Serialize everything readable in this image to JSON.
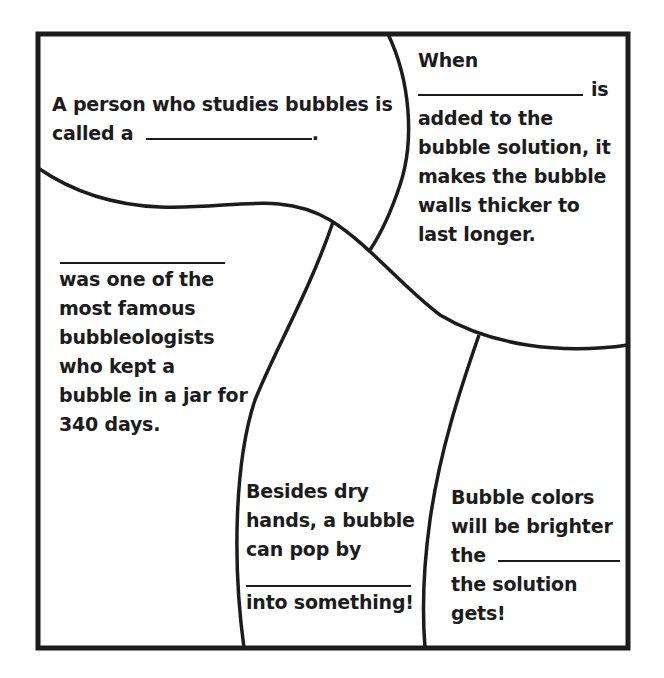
{
  "worksheet": {
    "colors": {
      "ink": "#1c1c1c",
      "paper": "#ffffff"
    },
    "sections": [
      {
        "id": "bubble-scientist",
        "lines": [
          "A person who studies bubbles is",
          "called a",
          "."
        ],
        "blank_count": 1
      },
      {
        "id": "bubble-thickener",
        "lines": [
          "When",
          "is",
          "added to the",
          "bubble solution, it",
          "makes the bubble",
          "walls thicker to",
          "last longer."
        ],
        "blank_count": 1
      },
      {
        "id": "famous-bubbleologist",
        "lines": [
          "was one of the",
          "most famous",
          "bubbleologists",
          "who kept a",
          "bubble in a jar for",
          "340 days."
        ],
        "blank_count": 1
      },
      {
        "id": "bubble-pop",
        "lines": [
          "Besides dry",
          "hands, a bubble",
          "can pop by",
          "into something!"
        ],
        "blank_count": 1
      },
      {
        "id": "bubble-colors",
        "lines": [
          "Bubble colors",
          "will be brighter",
          "the",
          "the solution",
          "gets!"
        ],
        "blank_count": 1
      }
    ]
  }
}
